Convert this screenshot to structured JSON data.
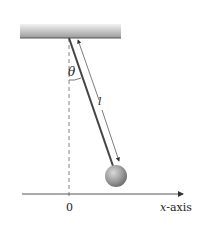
{
  "diagram": {
    "labels": {
      "angle": "θ",
      "length": "l",
      "origin": "0",
      "x_axis_var": "x",
      "x_axis_suffix": "-axis"
    },
    "colors": {
      "ceiling_light": "#e8e8e8",
      "ceiling_dark": "#9a9a9a",
      "rod": "#444444",
      "bob": "#8a8a8a",
      "axis": "#555555",
      "dashed": "#666666"
    }
  }
}
